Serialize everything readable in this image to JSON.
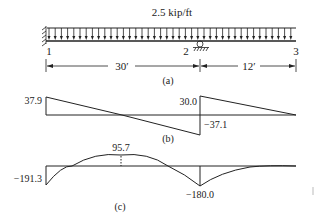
{
  "beam": {
    "load_label": "2.5 kip/ft",
    "nodes": [
      {
        "id": "1",
        "label": "1",
        "support": "fixed"
      },
      {
        "id": "2",
        "label": "2",
        "support": "roller"
      },
      {
        "id": "3",
        "label": "3",
        "support": "free"
      }
    ],
    "spans": [
      {
        "from": "1",
        "to": "2",
        "label": "30′"
      },
      {
        "from": "2",
        "to": "3",
        "label": "12′"
      }
    ],
    "caption": "(a)"
  },
  "shear": {
    "caption": "(b)",
    "values": {
      "left": "37.9",
      "at_support_left": "−37.1",
      "at_support_right": "30.0"
    }
  },
  "moment": {
    "caption": "(c)",
    "values": {
      "left": "−191.3",
      "span_max": "95.7",
      "at_support": "−180.0"
    }
  },
  "chart_data": [
    {
      "type": "line",
      "title": "Shear diagram (b)",
      "x": [
        0,
        0,
        15.16,
        30,
        30,
        42
      ],
      "values": [
        0,
        37.9,
        0,
        -37.1,
        30.0,
        0
      ],
      "labels": [
        "37.9",
        "−37.1",
        "30.0"
      ],
      "xlabel": "Position (ft)",
      "ylabel": "Shear (kip)"
    },
    {
      "type": "line",
      "title": "Moment diagram (c)",
      "x": [
        0,
        15.16,
        30,
        42
      ],
      "values": [
        -191.3,
        95.7,
        -180.0,
        0
      ],
      "labels": [
        "−191.3",
        "95.7",
        "−180.0"
      ],
      "xlabel": "Position (ft)",
      "ylabel": "Moment (kip·ft)"
    }
  ]
}
